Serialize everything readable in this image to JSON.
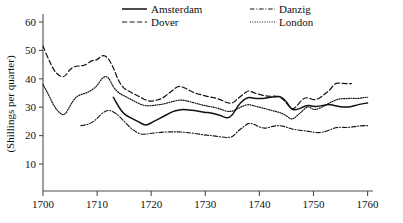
{
  "chart_data": {
    "type": "line",
    "title": "",
    "subtitle": "",
    "xlabel": "",
    "ylabel": "(Shillings per quarter)",
    "xlim": [
      1700,
      1761
    ],
    "ylim": [
      0,
      63
    ],
    "xticks": [
      1700,
      1710,
      1720,
      1730,
      1740,
      1750,
      1760
    ],
    "xtick_labels": [
      "1700",
      "1710",
      "1720",
      "1730",
      "1740",
      "1750",
      "1760"
    ],
    "yticks": [
      10,
      20,
      30,
      40,
      50,
      60
    ],
    "ytick_labels": [
      "10",
      "20",
      "30",
      "40",
      "50",
      "60"
    ],
    "grid": false,
    "legend_position": "top-center",
    "legend": [
      "Amsterdam",
      "Dover",
      "Danzig",
      "London"
    ],
    "series": [
      {
        "name": "Amsterdam",
        "style": "solid",
        "x": [
          1713,
          1714,
          1715,
          1716,
          1717,
          1718,
          1719,
          1720,
          1721,
          1722,
          1723,
          1724,
          1725,
          1726,
          1727,
          1728,
          1729,
          1730,
          1731,
          1732,
          1733,
          1734,
          1735,
          1736,
          1737,
          1738,
          1739,
          1740,
          1741,
          1742,
          1743,
          1744,
          1745,
          1746,
          1747,
          1748,
          1749,
          1750,
          1751,
          1752,
          1753,
          1754,
          1755,
          1756,
          1757,
          1758,
          1759,
          1760
        ],
        "values": [
          33.5,
          30.0,
          27.5,
          26.5,
          25.5,
          24.5,
          23.5,
          24.5,
          25.5,
          26.5,
          27.5,
          28.5,
          29.0,
          29.2,
          29.0,
          28.8,
          28.5,
          28.2,
          28.0,
          27.5,
          27.0,
          26.0,
          27.0,
          30.5,
          32.5,
          33.5,
          33.2,
          33.0,
          33.2,
          33.5,
          33.7,
          33.8,
          32.0,
          29.0,
          29.2,
          30.0,
          30.8,
          30.2,
          30.3,
          30.8,
          31.0,
          30.5,
          30.2,
          30.0,
          30.2,
          30.8,
          31.2,
          31.5
        ]
      },
      {
        "name": "Dover",
        "style": "dashed",
        "x": [
          1700,
          1701,
          1702,
          1703,
          1704,
          1705,
          1706,
          1707,
          1708,
          1709,
          1710,
          1711,
          1712,
          1713,
          1714,
          1715,
          1716,
          1717,
          1718,
          1719,
          1720,
          1721,
          1722,
          1723,
          1724,
          1725,
          1726,
          1727,
          1728,
          1729,
          1730,
          1731,
          1732,
          1733,
          1734,
          1735,
          1736,
          1737,
          1738,
          1739,
          1740,
          1741,
          1742,
          1743,
          1744,
          1745,
          1746,
          1747,
          1748,
          1749,
          1750,
          1751,
          1752,
          1753,
          1754,
          1755,
          1756,
          1757
        ],
        "values": [
          51.5,
          47.0,
          43.0,
          41.0,
          40.5,
          43.5,
          44.5,
          44.5,
          45.0,
          46.5,
          46.5,
          48.5,
          47.5,
          44.0,
          39.0,
          36.5,
          35.5,
          34.5,
          33.5,
          32.5,
          32.0,
          32.5,
          33.0,
          34.5,
          36.0,
          37.5,
          37.0,
          36.0,
          35.0,
          34.5,
          34.0,
          33.5,
          33.2,
          32.5,
          31.5,
          31.3,
          33.0,
          34.5,
          36.0,
          35.0,
          34.5,
          34.0,
          33.8,
          34.0,
          33.5,
          31.5,
          29.0,
          30.5,
          33.0,
          33.5,
          32.5,
          33.0,
          34.5,
          36.0,
          38.5,
          38.5,
          38.3,
          38.3
        ]
      },
      {
        "name": "Danzig",
        "style": "dashdot",
        "x": [
          1707,
          1708,
          1709,
          1710,
          1711,
          1712,
          1713,
          1714,
          1715,
          1716,
          1717,
          1718,
          1719,
          1720,
          1721,
          1722,
          1723,
          1724,
          1725,
          1726,
          1727,
          1728,
          1729,
          1730,
          1731,
          1732,
          1733,
          1734,
          1735,
          1736,
          1737,
          1738,
          1739,
          1740,
          1741,
          1742,
          1743,
          1744,
          1745,
          1746,
          1747,
          1748,
          1749,
          1750,
          1751,
          1752,
          1753,
          1754,
          1755,
          1756,
          1757,
          1758,
          1759,
          1760
        ],
        "values": [
          23.5,
          23.8,
          24.5,
          26.0,
          28.0,
          29.0,
          28.5,
          27.0,
          25.0,
          23.0,
          21.5,
          20.5,
          20.5,
          20.8,
          21.0,
          21.2,
          21.3,
          21.3,
          21.3,
          21.2,
          21.0,
          20.8,
          20.5,
          20.2,
          20.0,
          19.8,
          19.5,
          19.3,
          19.5,
          21.5,
          23.0,
          24.5,
          24.0,
          23.0,
          22.5,
          23.0,
          23.5,
          23.5,
          23.0,
          22.3,
          22.0,
          21.8,
          21.5,
          21.2,
          21.0,
          21.3,
          22.0,
          22.8,
          23.0,
          22.8,
          23.0,
          23.3,
          23.5,
          23.5
        ]
      },
      {
        "name": "London",
        "style": "dotted",
        "x": [
          1700,
          1701,
          1702,
          1703,
          1704,
          1705,
          1706,
          1707,
          1708,
          1709,
          1710,
          1711,
          1712,
          1713,
          1714,
          1715,
          1716,
          1717,
          1718,
          1719,
          1720,
          1721,
          1722,
          1723,
          1724,
          1725,
          1726,
          1727,
          1728,
          1729,
          1730,
          1731,
          1732,
          1733,
          1734,
          1735,
          1736,
          1737,
          1738,
          1739,
          1740,
          1741,
          1742,
          1743,
          1744,
          1745,
          1746,
          1747,
          1748,
          1749,
          1750,
          1751,
          1752,
          1753,
          1754,
          1755,
          1756,
          1757,
          1758,
          1759,
          1760
        ],
        "values": [
          38.0,
          34.5,
          30.5,
          28.0,
          27.0,
          30.5,
          33.5,
          34.5,
          35.0,
          36.0,
          37.5,
          40.5,
          41.0,
          37.0,
          35.0,
          34.0,
          33.0,
          32.0,
          31.0,
          30.5,
          30.5,
          30.8,
          31.0,
          31.5,
          32.0,
          32.5,
          32.5,
          32.0,
          31.5,
          31.0,
          30.5,
          30.2,
          29.8,
          29.2,
          28.5,
          28.5,
          29.5,
          30.5,
          31.0,
          30.5,
          30.0,
          29.5,
          29.0,
          28.5,
          28.0,
          27.0,
          25.5,
          27.0,
          28.8,
          30.5,
          29.0,
          29.5,
          30.5,
          31.5,
          32.5,
          33.0,
          33.0,
          33.2,
          33.0,
          33.3,
          33.5
        ]
      }
    ]
  },
  "legend": {
    "items": [
      {
        "label": "Amsterdam",
        "style": "solid"
      },
      {
        "label": "Danzig",
        "style": "dashdot"
      },
      {
        "label": "Dover",
        "style": "dashed"
      },
      {
        "label": "London",
        "style": "dotted"
      }
    ]
  },
  "axes": {
    "ylabel": "(Shillings per quarter)",
    "ytick_labels": [
      "60",
      "50",
      "40",
      "30",
      "20",
      "10"
    ],
    "xtick_labels": [
      "1700",
      "1710",
      "1720",
      "1730",
      "1740",
      "1750",
      "1760"
    ]
  }
}
